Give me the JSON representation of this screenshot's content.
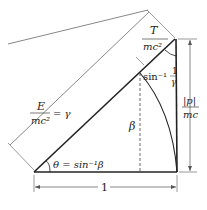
{
  "diagram": {
    "labels": {
      "T_num": "T",
      "T_den": "mc²",
      "E_num": "E",
      "E_den": "mc²",
      "E_eq": "= γ",
      "p_num": "|p|",
      "p_den": "mc",
      "beta": "β",
      "theta": "θ = sin⁻¹β",
      "top_angle_sin": "sin⁻¹",
      "top_angle_num": "1",
      "top_angle_den": "γ",
      "base": "1"
    },
    "colors": {
      "line": "#222222",
      "dim": "#555555",
      "bg": "#ffffff"
    }
  }
}
